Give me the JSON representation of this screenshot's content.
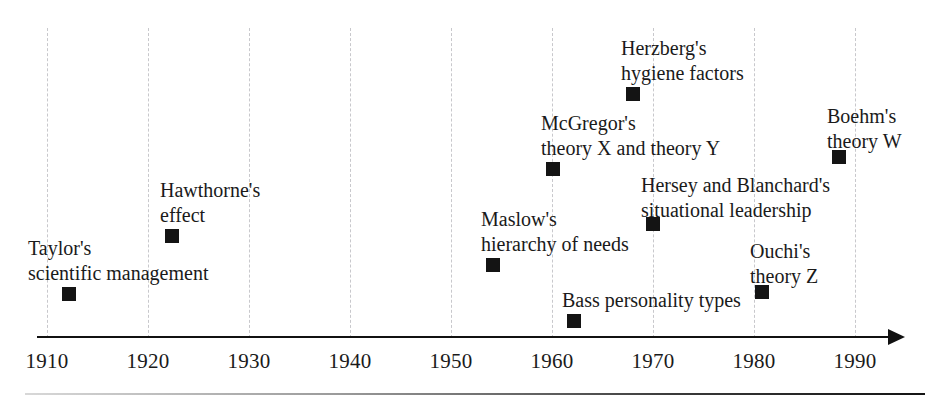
{
  "figure": {
    "type": "timeline",
    "title": "",
    "axis": {
      "orientation": "horizontal",
      "arrow": "right",
      "range_start": 1910,
      "range_end": 1990,
      "tick_step": 10,
      "pixels_per_decade": 101,
      "ticks": [
        {
          "label": "1910",
          "value": 1910,
          "x": 47
        },
        {
          "label": "1920",
          "value": 1920,
          "x": 148
        },
        {
          "label": "1930",
          "value": 1930,
          "x": 249
        },
        {
          "label": "1940",
          "value": 1940,
          "x": 350
        },
        {
          "label": "1950",
          "value": 1950,
          "x": 451
        },
        {
          "label": "1960",
          "value": 1960,
          "x": 552
        },
        {
          "label": "1970",
          "value": 1970,
          "x": 653
        },
        {
          "label": "1980",
          "value": 1980,
          "x": 754
        },
        {
          "label": "1990",
          "value": 1990,
          "x": 855
        }
      ]
    },
    "grid": {
      "visible": true,
      "style": "dashed",
      "color": "#c8c8cc",
      "top": 28,
      "height": 310
    },
    "marker_style": {
      "shape": "square",
      "size": 14,
      "color": "#141414"
    },
    "events": [
      {
        "name": "taylor-scientific-management",
        "line1": "Taylor's",
        "line2": "scientific management",
        "year": 1912,
        "marker_x": 62,
        "marker_y": 287,
        "label_x": 28,
        "label_y": 236
      },
      {
        "name": "hawthorne-effect",
        "line1": "Hawthorne's",
        "line2": "effect",
        "year": 1922,
        "marker_x": 165,
        "marker_y": 229,
        "label_x": 160,
        "label_y": 178
      },
      {
        "name": "maslow-hierarchy-of-needs",
        "line1": "Maslow's",
        "line2": "hierarchy of needs",
        "year": 1954,
        "marker_x": 486,
        "marker_y": 258,
        "label_x": 481,
        "label_y": 207
      },
      {
        "name": "mcgregor-theory-x-and-theory-y",
        "line1": "McGregor's",
        "line2": "theory X and theory Y",
        "year": 1960,
        "marker_x": 546,
        "marker_y": 162,
        "label_x": 541,
        "label_y": 111
      },
      {
        "name": "bass-personality-types",
        "line1": "Bass personality types",
        "line2": "",
        "year": 1962,
        "marker_x": 567,
        "marker_y": 314,
        "label_x": 562,
        "label_y": 288
      },
      {
        "name": "herzberg-hygiene-factors",
        "line1": "Herzberg's",
        "line2": "hygiene factors",
        "year": 1968,
        "marker_x": 626,
        "marker_y": 87,
        "label_x": 621,
        "label_y": 36
      },
      {
        "name": "hersey-and-blanchard-situational-leadership",
        "line1": "Hersey and Blanchard's",
        "line2": "situational leadership",
        "year": 1969,
        "marker_x": 646,
        "marker_y": 217,
        "label_x": 641,
        "label_y": 173
      },
      {
        "name": "ouchi-theory-z",
        "line1": "Ouchi's",
        "line2": "theory Z",
        "year": 1981,
        "marker_x": 755,
        "marker_y": 285,
        "label_x": 750,
        "label_y": 239
      },
      {
        "name": "boehm-theory-w",
        "line1": "Boehm's",
        "line2": "theory W",
        "year": 1988,
        "marker_x": 832,
        "marker_y": 150,
        "label_x": 827,
        "label_y": 104
      }
    ],
    "axis_geometry": {
      "line_left": 37,
      "line_top": 336,
      "line_width": 853,
      "arrow_x": 888
    }
  }
}
